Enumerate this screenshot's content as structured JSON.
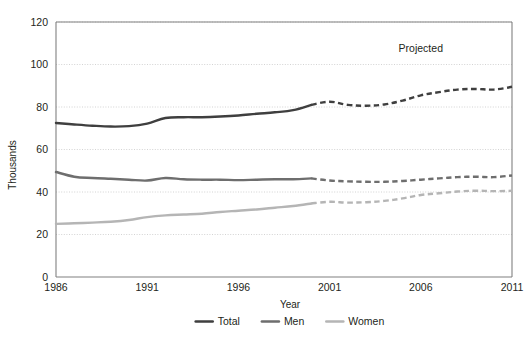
{
  "chart_data": {
    "type": "line",
    "title": "",
    "subtitle": "",
    "xlabel": "Year",
    "ylabel": "Thousands",
    "xlim": [
      1986,
      2011
    ],
    "ylim": [
      0,
      120
    ],
    "ytick_labels": [
      "0",
      "20",
      "40",
      "60",
      "80",
      "100",
      "120"
    ],
    "ytick_values": [
      0,
      20,
      40,
      60,
      80,
      100,
      120
    ],
    "xtick_labels": [
      "1986",
      "1991",
      "1996",
      "2001",
      "2006",
      "2011"
    ],
    "xtick_values": [
      1986,
      1991,
      1996,
      2001,
      2006,
      2011
    ],
    "grid": "horizontal-dotted",
    "legend_position": "bottom-center",
    "projection_start_year": 2000,
    "annotations": [
      {
        "text": "Projected",
        "x": 2006,
        "y": 106
      }
    ],
    "x": [
      1986,
      1987,
      1988,
      1989,
      1990,
      1991,
      1992,
      1993,
      1994,
      1995,
      1996,
      1997,
      1998,
      1999,
      2000,
      2001,
      2002,
      2003,
      2004,
      2005,
      2006,
      2007,
      2008,
      2009,
      2010,
      2011
    ],
    "series": [
      {
        "name": "Total",
        "color": "#3f3f3f",
        "values": [
          72.5,
          71.8,
          71.2,
          70.8,
          71.0,
          72.2,
          74.8,
          75.2,
          75.2,
          75.5,
          76.0,
          76.8,
          77.5,
          78.5,
          81.0,
          82.5,
          81.0,
          80.6,
          81.2,
          83.0,
          85.5,
          87.0,
          88.2,
          88.5,
          88.2,
          89.5
        ]
      },
      {
        "name": "Men",
        "color": "#6e6e6e",
        "values": [
          49.4,
          47.2,
          46.6,
          46.2,
          45.8,
          45.4,
          46.6,
          46.0,
          45.8,
          45.8,
          45.6,
          45.8,
          46.0,
          46.0,
          46.4,
          45.4,
          45.0,
          44.8,
          44.8,
          45.2,
          45.8,
          46.4,
          47.0,
          47.2,
          47.0,
          47.8
        ]
      },
      {
        "name": "Women",
        "color": "#b5b5b5",
        "values": [
          25.0,
          25.3,
          25.6,
          26.0,
          26.8,
          28.2,
          29.0,
          29.4,
          29.8,
          30.6,
          31.2,
          31.8,
          32.6,
          33.4,
          34.6,
          35.4,
          35.0,
          35.2,
          35.8,
          37.0,
          38.6,
          39.4,
          40.2,
          40.6,
          40.4,
          40.6
        ]
      }
    ]
  },
  "legend": {
    "items": [
      {
        "label": "Total",
        "color": "#3f3f3f"
      },
      {
        "label": "Men",
        "color": "#6e6e6e"
      },
      {
        "label": "Women",
        "color": "#b5b5b5"
      }
    ]
  },
  "axes": {
    "x_title": "Year",
    "y_title": "Thousands"
  },
  "colors": {
    "total": "#3f3f3f",
    "men": "#6e6e6e",
    "women": "#b5b5b5",
    "axis": "#808080",
    "grid": "#c8c8c8",
    "text": "#231f20",
    "background": "#ffffff"
  }
}
